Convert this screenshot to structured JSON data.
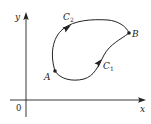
{
  "figure": {
    "type": "line-integral-paths",
    "axes": {
      "x_label": "x",
      "y_label": "y",
      "origin_label": "0"
    },
    "points": [
      {
        "name": "A",
        "label": "A"
      },
      {
        "name": "B",
        "label": "B"
      }
    ],
    "curves": [
      {
        "name": "C1",
        "label_base": "C",
        "label_sub": "1",
        "from": "A",
        "to": "B",
        "direction": "lower path, arrow toward B"
      },
      {
        "name": "C2",
        "label_base": "C",
        "label_sub": "2",
        "from": "A",
        "to": "B",
        "direction": "upper path, arrow toward B"
      }
    ],
    "colors": {
      "stroke": "#222222",
      "background": "#ffffff"
    }
  }
}
